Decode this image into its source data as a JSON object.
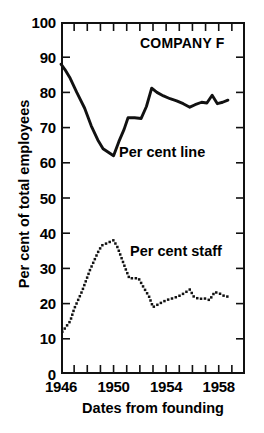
{
  "chart_data": {
    "type": "line",
    "title": "COMPANY F",
    "xlabel": "Dates from founding",
    "ylabel": "Per cent of total employees",
    "xlim": [
      1946,
      1960
    ],
    "ylim": [
      0,
      100
    ],
    "grid": false,
    "legend_position": "inline-annotation",
    "y_ticks": [
      0,
      10,
      20,
      30,
      40,
      50,
      60,
      70,
      80,
      90,
      100
    ],
    "y_tick_labels": [
      "0",
      "10",
      "20",
      "30",
      "40",
      "50",
      "60",
      "70",
      "80",
      "90",
      "100"
    ],
    "x_ticks": [
      1946,
      1947,
      1948,
      1949,
      1950,
      1951,
      1952,
      1953,
      1954,
      1955,
      1956,
      1957,
      1958,
      1959,
      1960
    ],
    "x_tick_labels_shown": [
      "1946",
      "1950",
      "1954",
      "1958"
    ],
    "x_tick_label_values": [
      1946,
      1950,
      1954,
      1958
    ],
    "series": [
      {
        "name": "Per cent line",
        "style": "solid",
        "color": "#111111",
        "annotation": "Per cent line",
        "x": [
          1946.0,
          1946.3,
          1946.7,
          1947.2,
          1947.8,
          1948.3,
          1948.8,
          1949.2,
          1949.6,
          1950.0,
          1950.4,
          1950.8,
          1951.1,
          1951.6,
          1952.1,
          1952.5,
          1952.9,
          1953.3,
          1953.8,
          1954.3,
          1954.8,
          1955.3,
          1955.8,
          1956.2,
          1956.7,
          1957.1,
          1957.5,
          1957.9,
          1958.3,
          1958.7
        ],
        "y": [
          88.0,
          86.5,
          84.0,
          80.0,
          75.5,
          70.5,
          66.5,
          64.0,
          63.0,
          62.0,
          66.0,
          69.5,
          72.8,
          72.8,
          72.6,
          76.0,
          81.2,
          80.0,
          79.0,
          78.2,
          77.6,
          76.8,
          75.8,
          76.5,
          77.2,
          77.0,
          79.2,
          76.8,
          77.2,
          77.8
        ]
      },
      {
        "name": "Per cent staff",
        "style": "dotted",
        "color": "#111111",
        "annotation": "Per cent staff",
        "x": [
          1946.1,
          1946.4,
          1946.7,
          1947.0,
          1947.3,
          1947.6,
          1947.9,
          1948.2,
          1948.5,
          1948.8,
          1949.1,
          1949.4,
          1949.7,
          1950.0,
          1950.3,
          1950.6,
          1950.9,
          1951.2,
          1951.5,
          1951.9,
          1952.3,
          1952.7,
          1953.0,
          1953.4,
          1953.8,
          1954.2,
          1954.6,
          1955.0,
          1955.4,
          1955.8,
          1956.1,
          1956.5,
          1956.9,
          1957.3,
          1957.7,
          1958.1,
          1958.5,
          1958.9
        ],
        "y": [
          12.0,
          13.5,
          15.0,
          18.5,
          21.0,
          23.5,
          26.5,
          29.5,
          32.0,
          34.5,
          36.5,
          37.0,
          37.5,
          38.0,
          36.0,
          33.0,
          30.0,
          27.2,
          27.2,
          27.2,
          24.5,
          22.0,
          19.0,
          19.8,
          20.6,
          21.2,
          21.6,
          22.2,
          23.0,
          24.0,
          22.0,
          21.3,
          21.5,
          21.0,
          23.3,
          22.8,
          22.0,
          22.0
        ]
      }
    ]
  },
  "axes": {
    "y_title": "Per cent of total employees",
    "x_title": "Dates from founding"
  },
  "annotations": {
    "company": "COMPANY F",
    "series_line": "Per cent line",
    "series_staff": "Per cent staff"
  },
  "colors": {
    "ink": "#111111",
    "background": "#ffffff"
  }
}
